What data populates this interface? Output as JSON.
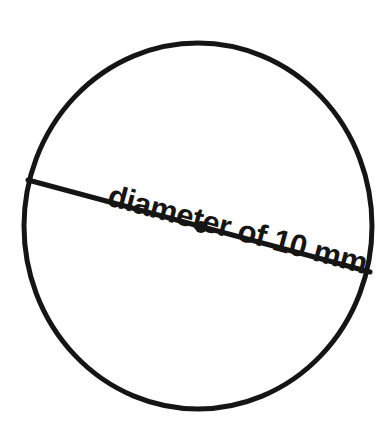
{
  "figure": {
    "kind": "geometry-diagram",
    "background_color": "#ffffff",
    "stroke_color": "#151515",
    "caption": "diameter of 10 mm",
    "measurement": {
      "quantity": "diameter",
      "value": "10",
      "unit": "mm",
      "label": "diameter of 10 mm"
    },
    "circle": {
      "center_x": 198,
      "center_y": 226,
      "radius_x": 174,
      "radius_y": 183,
      "stroke_width": 5,
      "fill": "none"
    },
    "diameter_segment": {
      "x1": 28,
      "y1": 180,
      "x2": 370,
      "y2": 272,
      "stroke_width": 5,
      "angle_degrees": 15
    },
    "center_point": {
      "x": 201,
      "y": 227,
      "radius": 6,
      "fill": "#151515"
    },
    "label_placement": {
      "anchor_x": 106,
      "anchor_y": 205,
      "rotation_degrees": 15,
      "font_size": 31,
      "font_weight": "bold"
    }
  }
}
